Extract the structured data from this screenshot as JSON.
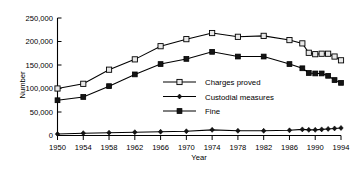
{
  "chart_data": {
    "type": "line",
    "title": "",
    "xlabel": "Year",
    "ylabel": "Number",
    "grid": false,
    "legend_position": "inside-right-middle",
    "xlim": [
      1950,
      1994
    ],
    "ylim": [
      0,
      250000
    ],
    "ytick_labels": [
      "250,000",
      "200,000",
      "150,000",
      "100,000",
      "50,000",
      "0"
    ],
    "ytick_values": [
      250000,
      200000,
      150000,
      100000,
      50000,
      0
    ],
    "xtick_labels": [
      "1950",
      "1954",
      "1958",
      "1962",
      "1966",
      "1970",
      "1974",
      "1978",
      "1982",
      "1986",
      "1990",
      "1994"
    ],
    "xtick_values": [
      1950,
      1954,
      1958,
      1962,
      1966,
      1970,
      1974,
      1978,
      1982,
      1986,
      1990,
      1994
    ],
    "series": [
      {
        "name": "Charges proved",
        "marker": "open-square",
        "x": [
          1950,
          1954,
          1958,
          1962,
          1966,
          1970,
          1974,
          1978,
          1982,
          1986,
          1988,
          1989,
          1990,
          1991,
          1992,
          1993,
          1994
        ],
        "values": [
          100000,
          110000,
          140000,
          162000,
          190000,
          205000,
          218000,
          210000,
          212000,
          203000,
          196000,
          176000,
          173000,
          174000,
          174000,
          168000,
          160000
        ]
      },
      {
        "name": "Custodial measures",
        "marker": "filled-diamond",
        "x": [
          1950,
          1954,
          1958,
          1962,
          1966,
          1970,
          1974,
          1978,
          1982,
          1986,
          1988,
          1989,
          1990,
          1991,
          1992,
          1993,
          1994
        ],
        "values": [
          3000,
          5000,
          6000,
          7000,
          8000,
          9000,
          12000,
          10000,
          10000,
          11000,
          13000,
          12000,
          12000,
          13000,
          14000,
          15000,
          16000
        ]
      },
      {
        "name": "Fine",
        "marker": "filled-square",
        "x": [
          1950,
          1954,
          1958,
          1962,
          1966,
          1970,
          1974,
          1978,
          1982,
          1986,
          1988,
          1989,
          1990,
          1991,
          1992,
          1993,
          1994
        ],
        "values": [
          75000,
          82000,
          105000,
          130000,
          152000,
          163000,
          178000,
          168000,
          168000,
          152000,
          143000,
          133000,
          132000,
          132000,
          127000,
          118000,
          112000
        ]
      }
    ]
  },
  "legend": {
    "items": [
      {
        "label": "Charges proved",
        "marker": "open-square"
      },
      {
        "label": "Custodial measures",
        "marker": "filled-diamond"
      },
      {
        "label": "Fine",
        "marker": "filled-square"
      }
    ]
  }
}
